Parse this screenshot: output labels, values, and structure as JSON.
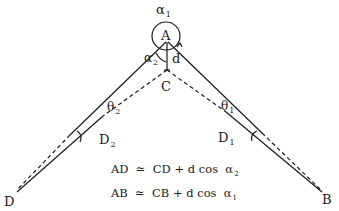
{
  "diagram": {
    "type": "geometry",
    "colors": {
      "line": "#1a1a1a",
      "background": "#ffffff"
    },
    "points": {
      "A": {
        "label": "A"
      },
      "B": {
        "label": "B"
      },
      "C": {
        "label": "C"
      },
      "D": {
        "label": "D"
      },
      "D1": {
        "label": "D",
        "sub": "1"
      },
      "D2": {
        "label": "D",
        "sub": "2"
      }
    },
    "angles": {
      "alpha1": {
        "label": "α",
        "sub": "1"
      },
      "alpha2": {
        "label": "α",
        "sub": "2"
      },
      "theta1": {
        "label": "θ",
        "sub": "1"
      },
      "theta2": {
        "label": "θ",
        "sub": "2"
      }
    },
    "distance": {
      "d": "d"
    },
    "equations": [
      {
        "lhs": "AD",
        "rel": "≃",
        "rhs": "CD + d cos",
        "angle": "α",
        "sub": "2"
      },
      {
        "lhs": "AB",
        "rel": "≃",
        "rhs": "CB + d cos",
        "angle": "α",
        "sub": "1"
      }
    ]
  }
}
